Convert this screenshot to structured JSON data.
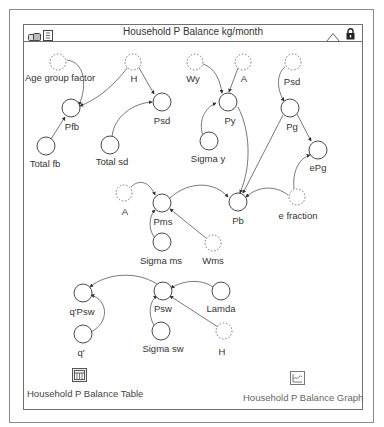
{
  "window": {
    "title": "Household P Balance kg/month",
    "icons": [
      "model-icon",
      "document-icon",
      "collapse-triangle-icon",
      "lock-icon"
    ]
  },
  "nodes": {
    "age_group_factor": {
      "label": "Age group factor",
      "type": "ghost"
    },
    "h_top": {
      "label": "H",
      "type": "ghost"
    },
    "pfb": {
      "label": "Pfb",
      "type": "converter"
    },
    "psd_left": {
      "label": "Psd",
      "type": "converter"
    },
    "total_fb": {
      "label": "Total fb",
      "type": "converter"
    },
    "total_sd": {
      "label": "Total sd",
      "type": "converter"
    },
    "wy": {
      "label": "Wy",
      "type": "ghost"
    },
    "a_top": {
      "label": "A",
      "type": "ghost"
    },
    "py": {
      "label": "Py",
      "type": "converter"
    },
    "sigma_y": {
      "label": "Sigma y",
      "type": "converter"
    },
    "psd_right": {
      "label": "Psd",
      "type": "ghost"
    },
    "pg": {
      "label": "Pg",
      "type": "converter"
    },
    "epg": {
      "label": "ePg",
      "type": "converter"
    },
    "a_mid": {
      "label": "A",
      "type": "ghost"
    },
    "pms": {
      "label": "Pms",
      "type": "converter"
    },
    "pb": {
      "label": "Pb",
      "type": "converter"
    },
    "e_fraction": {
      "label": "e fraction",
      "type": "ghost"
    },
    "sigma_ms": {
      "label": "Sigma ms",
      "type": "converter"
    },
    "wms": {
      "label": "Wms",
      "type": "ghost"
    },
    "q_psw": {
      "label": "q'Psw",
      "type": "converter"
    },
    "psw": {
      "label": "Psw",
      "type": "converter"
    },
    "lamda": {
      "label": "Lamda",
      "type": "converter"
    },
    "q_prime": {
      "label": "q'",
      "type": "converter"
    },
    "sigma_sw": {
      "label": "Sigma sw",
      "type": "converter"
    },
    "h_bottom": {
      "label": "H",
      "type": "ghost"
    }
  },
  "links": [
    [
      "age_group_factor",
      "pfb"
    ],
    [
      "h_top",
      "pfb"
    ],
    [
      "h_top",
      "psd_left"
    ],
    [
      "total_fb",
      "pfb"
    ],
    [
      "total_sd",
      "psd_left"
    ],
    [
      "wy",
      "py"
    ],
    [
      "a_top",
      "py"
    ],
    [
      "sigma_y",
      "py"
    ],
    [
      "py",
      "pb"
    ],
    [
      "psd_right",
      "pg"
    ],
    [
      "pg",
      "pb"
    ],
    [
      "pg",
      "epg"
    ],
    [
      "e_fraction",
      "epg"
    ],
    [
      "a_mid",
      "pms"
    ],
    [
      "pms",
      "pb"
    ],
    [
      "e_fraction",
      "pb"
    ],
    [
      "sigma_ms",
      "pms"
    ],
    [
      "wms",
      "pms"
    ],
    [
      "psw",
      "q_psw"
    ],
    [
      "q_prime",
      "q_psw"
    ],
    [
      "lamda",
      "psw"
    ],
    [
      "sigma_sw",
      "psw"
    ],
    [
      "h_bottom",
      "psw"
    ]
  ],
  "bottom": {
    "table_label": "Household P Balance Table",
    "graph_label": "Household P Balance Graph"
  },
  "colors": {
    "stroke": "#333333",
    "ghost_stroke": "#555555",
    "border": "#707070"
  }
}
